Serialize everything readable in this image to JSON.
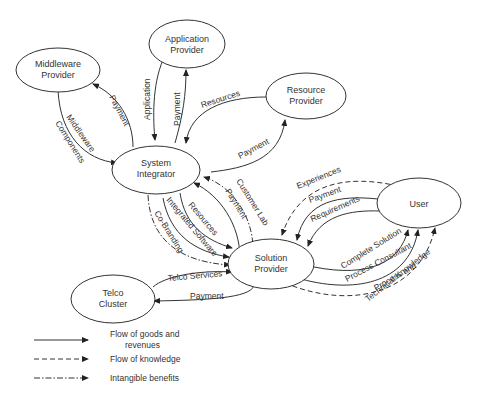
{
  "diagram": {
    "nodes": {
      "middleware": {
        "line1": "Middleware",
        "line2": "Provider"
      },
      "application": {
        "line1": "Application",
        "line2": "Provider"
      },
      "resource": {
        "line1": "Resource",
        "line2": "Provider"
      },
      "system": {
        "line1": "System",
        "line2": "Integrator"
      },
      "solution": {
        "line1": "Solution",
        "line2": "Provider"
      },
      "user": {
        "line1": "User"
      },
      "telco": {
        "line1": "Telco",
        "line2": "Cluster"
      }
    },
    "edges": {
      "mw_payment": "Payment",
      "mw_middleware": "Middleware",
      "mw_components": "Components",
      "app_application": "Application",
      "app_payment": "Payment",
      "res_resources": "Resources",
      "res_payment": "Payment",
      "si_customer_lab": "Customer Lab",
      "si_payment": "Payment",
      "si_resources": "Resources",
      "si_integrated_software": "Integrated Software",
      "si_co_branding": "Co-Branding",
      "user_experiences": "Experiences",
      "user_payment": "Payment",
      "user_requirements": "Requirements",
      "user_complete_solution": "Complete Solution",
      "user_process_consultant": "Process Consultant",
      "user_process_and": "Process and",
      "user_technical_knowledge": "Technical Knowledge",
      "telco_services": "Telco Services",
      "telco_payment": "Payment"
    }
  },
  "legend": {
    "items": [
      {
        "style": "solid",
        "line1": "Flow of goods and",
        "line2": "revenues"
      },
      {
        "style": "dashed",
        "line1": "Flow of knowledge"
      },
      {
        "style": "dashdot",
        "line1": "Intangible benefits"
      }
    ]
  },
  "colors": {
    "stroke": "#333333",
    "background": "#ffffff"
  }
}
